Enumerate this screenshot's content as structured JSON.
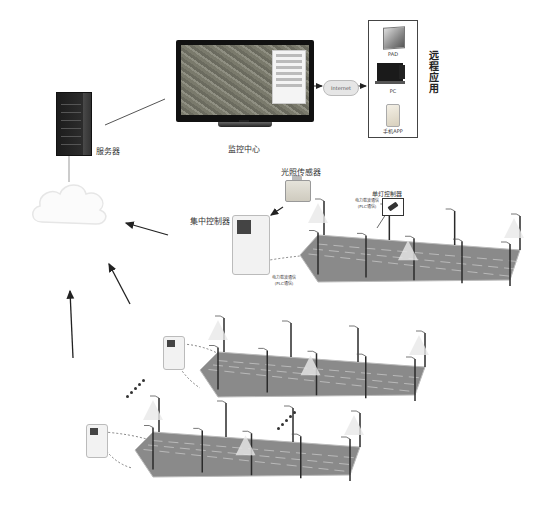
{
  "nodes": {
    "server": {
      "label": "服务器",
      "icon": "server-rack-icon"
    },
    "monitoring_center": {
      "label": "监控中心",
      "icon": "monitor-icon"
    },
    "internet": {
      "label": "Internet",
      "icon": "cloud-icon"
    },
    "remote_apps": {
      "label": "远程应用",
      "devices": [
        {
          "label": "PAD",
          "icon": "tablet-icon"
        },
        {
          "label": "PC",
          "icon": "desktop-pc-icon"
        },
        {
          "label": "手机APP",
          "icon": "smartphone-icon"
        }
      ]
    },
    "network_cloud": {
      "icon": "cloud-icon"
    },
    "light_sensor": {
      "label": "光照传感器",
      "icon": "light-sensor-icon"
    },
    "central_controller": {
      "label": "集中控制器",
      "icon": "controller-meter-icon"
    },
    "single_lamp_controller": {
      "label": "单灯控制器",
      "icon": "lamp-controller-icon"
    },
    "plc_comm_1": {
      "line1": "电力载波通信",
      "line2": "(PLC通信)"
    },
    "plc_comm_2": {
      "line1": "电力载波通信",
      "line2": "(PLC通信)"
    }
  },
  "street_segments": [
    {
      "name": "segment-1",
      "poles": 9
    },
    {
      "name": "segment-2",
      "poles": 9
    },
    {
      "name": "segment-3",
      "poles": 9
    }
  ],
  "ellipsis": "······"
}
